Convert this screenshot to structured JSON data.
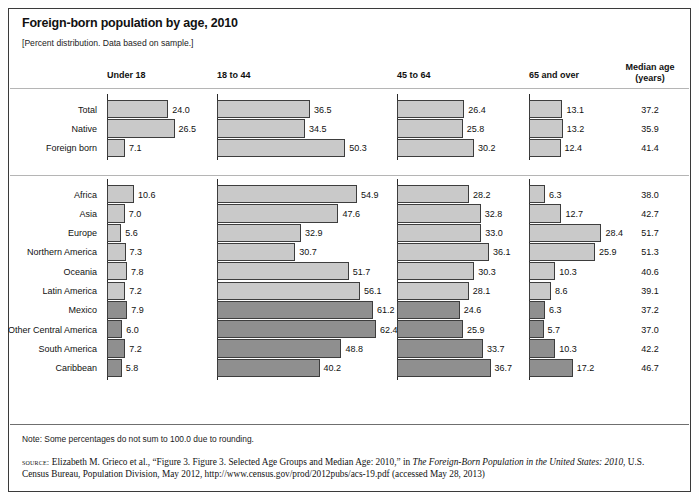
{
  "title": "Foreign-born population by age, 2010",
  "subtitle": "[Percent distribution. Data based on sample.]",
  "headers": {
    "under18": "Under 18",
    "age18to44": "18 to 44",
    "age45to64": "45 to 64",
    "age65plus": "65 and over",
    "median_line1": "Median age",
    "median_line2": "(years)"
  },
  "footer": {
    "note": "Note: Some percentages do not sum to 100.0 due to rounding.",
    "source_label": "source:",
    "source_part1": " Elizabeth M. Grieco et al., “Figure 3. Figure 3. Selected Age Groups and Median Age: 2010,” in ",
    "source_italic1": "The Foreign-Born Population in the United States: 2010",
    "source_part2": ", U.S. Census Bureau, Population Division, May 2012, http://www.census.gov/prod/2012pubs/acs-19.pdf (accessed May 28, 2013)"
  },
  "colors": {
    "bar_light": "#c9c9c9",
    "bar_dark": "#8f8f8f",
    "bar_border": "#3d3d3d",
    "frame": "#3a3a3a"
  },
  "chart_data": {
    "type": "bar",
    "title": "Foreign-born population by age, 2010",
    "subtitle": "[Percent distribution. Data based on sample.]",
    "xlabel": "Percent",
    "ylabel": "",
    "orientation": "horizontal",
    "grid": false,
    "legend": "none",
    "panels": [
      "Under 18",
      "18 to 44",
      "45 to 64",
      "65 and over",
      "Median age (years)"
    ],
    "categories": [
      "Total",
      "Native",
      "Foreign born",
      "Africa",
      "Asia",
      "Europe",
      "Northern America",
      "Oceania",
      "Latin America",
      "Mexico",
      "Other Central America",
      "South America",
      "Caribbean"
    ],
    "series": [
      {
        "name": "Under 18",
        "values": [
          24.0,
          26.5,
          7.1,
          10.6,
          7.0,
          5.6,
          7.3,
          7.8,
          7.2,
          7.9,
          6.0,
          7.2,
          5.8
        ]
      },
      {
        "name": "18 to 44",
        "values": [
          36.5,
          34.5,
          50.3,
          54.9,
          47.6,
          32.9,
          30.7,
          51.7,
          56.1,
          61.2,
          62.4,
          48.8,
          40.2
        ]
      },
      {
        "name": "45 to 64",
        "values": [
          26.4,
          25.8,
          30.2,
          28.2,
          32.8,
          33.0,
          36.1,
          30.3,
          28.1,
          24.6,
          25.9,
          33.7,
          36.7
        ]
      },
      {
        "name": "65 and over",
        "values": [
          13.1,
          13.2,
          12.4,
          6.3,
          12.7,
          28.4,
          25.9,
          10.3,
          8.6,
          6.3,
          5.7,
          10.3,
          17.2
        ]
      },
      {
        "name": "Median age (years)",
        "values": [
          37.2,
          35.9,
          41.4,
          38.0,
          42.7,
          51.7,
          51.3,
          40.6,
          39.1,
          37.2,
          37.0,
          42.2,
          46.7
        ]
      }
    ],
    "rows": [
      {
        "label": "Total",
        "under18": 24.0,
        "age18to44": 36.5,
        "age45to64": 26.4,
        "age65plus": 13.1,
        "median": 37.2,
        "shade": "light"
      },
      {
        "label": "Native",
        "under18": 26.5,
        "age18to44": 34.5,
        "age45to64": 25.8,
        "age65plus": 13.2,
        "median": 35.9,
        "shade": "light"
      },
      {
        "label": "Foreign born",
        "under18": 7.1,
        "age18to44": 50.3,
        "age45to64": 30.2,
        "age65plus": 12.4,
        "median": 41.4,
        "shade": "light"
      },
      {
        "label": "Africa",
        "under18": 10.6,
        "age18to44": 54.9,
        "age45to64": 28.2,
        "age65plus": 6.3,
        "median": 38.0,
        "shade": "light"
      },
      {
        "label": "Asia",
        "under18": 7.0,
        "age18to44": 47.6,
        "age45to64": 32.8,
        "age65plus": 12.7,
        "median": 42.7,
        "shade": "light"
      },
      {
        "label": "Europe",
        "under18": 5.6,
        "age18to44": 32.9,
        "age45to64": 33.0,
        "age65plus": 28.4,
        "median": 51.7,
        "shade": "light"
      },
      {
        "label": "Northern America",
        "under18": 7.3,
        "age18to44": 30.7,
        "age45to64": 36.1,
        "age65plus": 25.9,
        "median": 51.3,
        "shade": "light"
      },
      {
        "label": "Oceania",
        "under18": 7.8,
        "age18to44": 51.7,
        "age45to64": 30.3,
        "age65plus": 10.3,
        "median": 40.6,
        "shade": "light"
      },
      {
        "label": "Latin America",
        "under18": 7.2,
        "age18to44": 56.1,
        "age45to64": 28.1,
        "age65plus": 8.6,
        "median": 39.1,
        "shade": "light"
      },
      {
        "label": "Mexico",
        "under18": 7.9,
        "age18to44": 61.2,
        "age45to64": 24.6,
        "age65plus": 6.3,
        "median": 37.2,
        "shade": "dark"
      },
      {
        "label": "Other Central America",
        "under18": 6.0,
        "age18to44": 62.4,
        "age45to64": 25.9,
        "age65plus": 5.7,
        "median": 37.0,
        "shade": "dark"
      },
      {
        "label": "South America",
        "under18": 7.2,
        "age18to44": 48.8,
        "age45to64": 33.7,
        "age65plus": 10.3,
        "median": 42.2,
        "shade": "dark"
      },
      {
        "label": "Caribbean",
        "under18": 5.8,
        "age18to44": 40.2,
        "age45to64": 36.7,
        "age65plus": 17.2,
        "median": 46.7,
        "shade": "dark"
      }
    ]
  }
}
